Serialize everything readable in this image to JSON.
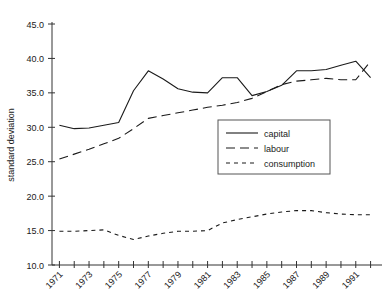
{
  "chart_data": {
    "type": "line",
    "title": "",
    "xlabel": "",
    "ylabel": "standard deviation",
    "xlim": [
      1970.5,
      1992.5
    ],
    "ylim": [
      10.0,
      45.0
    ],
    "grid": false,
    "legend_position": "center-right",
    "y_ticks": [
      "10.0",
      "15.0",
      "20.0",
      "25.0",
      "30.0",
      "35.0",
      "40.0",
      "45.0"
    ],
    "y_tick_values": [
      10.0,
      15.0,
      20.0,
      25.0,
      30.0,
      35.0,
      40.0,
      45.0
    ],
    "x_ticks": [
      "1971",
      "1973",
      "1975",
      "1977",
      "1979",
      "1981",
      "1983",
      "1985",
      "1987",
      "1989",
      "1991"
    ],
    "x_tick_values": [
      1971,
      1973,
      1975,
      1977,
      1979,
      1981,
      1983,
      1985,
      1987,
      1989,
      1991
    ],
    "x_minor_ticks": [
      1971,
      1972,
      1973,
      1974,
      1975,
      1976,
      1977,
      1978,
      1979,
      1980,
      1981,
      1982,
      1983,
      1984,
      1985,
      1986,
      1987,
      1988,
      1989,
      1990,
      1991,
      1992
    ],
    "x": [
      1971,
      1972,
      1973,
      1974,
      1975,
      1976,
      1977,
      1978,
      1979,
      1980,
      1981,
      1982,
      1983,
      1984,
      1985,
      1986,
      1987,
      1988,
      1989,
      1990,
      1991,
      1992
    ],
    "series": [
      {
        "name": "capital",
        "style": "solid",
        "color": "#1a1a1a",
        "values": [
          30.3,
          29.8,
          29.9,
          30.3,
          30.7,
          35.3,
          38.2,
          37.0,
          35.6,
          35.1,
          35.0,
          37.2,
          37.2,
          34.6,
          35.2,
          36.1,
          38.2,
          38.2,
          38.4,
          39.0,
          39.6,
          37.2
        ]
      },
      {
        "name": "labour",
        "style": "dashed-long",
        "color": "#1a1a1a",
        "values": [
          25.4,
          26.1,
          26.8,
          27.6,
          28.4,
          29.8,
          31.3,
          31.7,
          32.1,
          32.5,
          32.9,
          33.2,
          33.6,
          34.2,
          35.2,
          36.2,
          36.7,
          36.9,
          37.1,
          36.9,
          36.9,
          39.6
        ]
      },
      {
        "name": "consumption",
        "style": "dashed-short",
        "color": "#1a1a1a",
        "values": [
          14.9,
          14.9,
          15.0,
          15.1,
          14.3,
          13.7,
          14.2,
          14.6,
          14.9,
          14.9,
          15.0,
          16.1,
          16.6,
          17.0,
          17.4,
          17.7,
          17.9,
          17.9,
          17.6,
          17.4,
          17.3,
          17.3
        ]
      }
    ]
  },
  "legend": {
    "items": [
      {
        "label": "capital"
      },
      {
        "label": "labour"
      },
      {
        "label": "consumption"
      }
    ]
  }
}
